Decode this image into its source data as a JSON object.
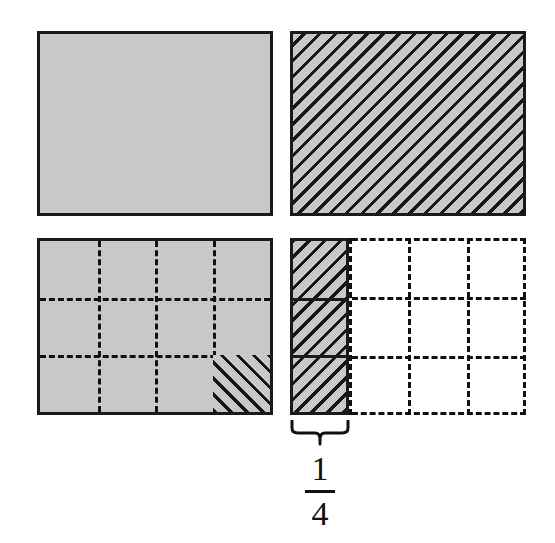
{
  "figure": {
    "background_color": "#ffffff",
    "shade_color": "#c8c8c8",
    "line_color": "#111111",
    "hatch_color": "#161616"
  },
  "panels": [
    {
      "id": "panel-solid",
      "name": "solid-shaded-rectangle",
      "fill": "solid-gray",
      "border": "solid",
      "grid": null,
      "description": "Whole rectangle shaded gray with no subdivisions"
    },
    {
      "id": "panel-hatched",
      "name": "fully-hatched-rectangle",
      "fill": "gray-with-diagonal-hatch",
      "hatch_direction": "down-right",
      "border": "solid",
      "grid": null,
      "description": "Whole rectangle shaded gray and covered with diagonal hatching"
    },
    {
      "id": "panel-grid-shaded",
      "name": "grid-shaded-rectangle",
      "fill": "solid-gray",
      "border": "solid",
      "grid": {
        "columns": 4,
        "rows": 3,
        "line_style": "dashed"
      },
      "hatched_cells": [
        {
          "row": 3,
          "column": 4,
          "hatch_direction": "up-right"
        }
      ],
      "description": "Gray rectangle divided by dashed lines into 4 columns and 3 rows; bottom-right cell hatched"
    },
    {
      "id": "panel-grid-fraction",
      "name": "grid-fraction-rectangle",
      "fill": "white",
      "border": "dashed",
      "grid": {
        "columns": 4,
        "rows": 3,
        "line_style": "dashed"
      },
      "hatched_region": {
        "name": "left-column",
        "columns_covered": 1,
        "of_total_columns": 4,
        "hatch_direction": "down-right",
        "border": "solid"
      },
      "description": "White rectangle with dashed 4x3 grid; leftmost column shaded gray and hatched with a solid outline"
    }
  ],
  "annotation": {
    "brace": {
      "name": "curly-brace",
      "orientation": "down",
      "spans": "left-column"
    },
    "fraction": {
      "numerator": "1",
      "denominator": "4",
      "text": "1/4"
    }
  }
}
